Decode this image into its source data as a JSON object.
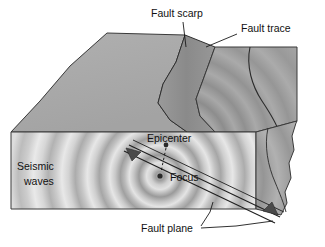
{
  "figure": {
    "background_color": "#ffffff",
    "width": 325,
    "height": 247
  },
  "labels": {
    "fault_scarp": "Fault scarp",
    "fault_trace": "Fault trace",
    "epicenter": "Epicenter",
    "focus": "Focus",
    "seismic_waves_line1": "Seismic",
    "seismic_waves_line2": "waves",
    "fault_plane": "Fault plane"
  },
  "colors": {
    "outline": "#3a3a3a",
    "text": "#111111",
    "top_surface_left": "#a8a8a8",
    "top_surface_right": "#9f9f9f",
    "scarp_face": "#8e8e8e",
    "front_face": "#c9c9c9",
    "side_face": "#9a9a9a",
    "wave_light": "#dcdcdc",
    "wave_dark": "#9b9b9b",
    "focus_dot": "#2a2a2a",
    "epicenter_dot": "#2a2a2a",
    "arrow_fill": "#4a4a4a"
  },
  "markers": {
    "focus_dot_radius": 2.6,
    "epicenter_dot_radius": 2.4,
    "focus_position": [
      160,
      176
    ],
    "epicenter_position": [
      166,
      145
    ]
  },
  "geometry": {
    "front_face_top_y": 132,
    "front_face_bottom_y": 209,
    "front_face_left_x": 11,
    "front_face_right_x": 256,
    "scarp_peak": [
      185,
      35
    ],
    "block_right_x": 295
  },
  "annotations": {
    "wave_ring_count_front": 9,
    "wave_ring_count_top": 8,
    "fault_arrow_count": 2
  }
}
